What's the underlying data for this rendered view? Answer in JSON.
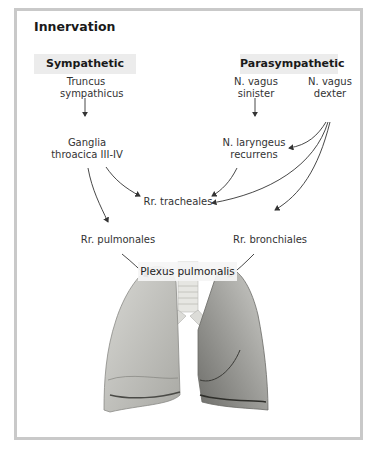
{
  "title": "Innervation",
  "headers": {
    "sympathetic": "Sympathetic",
    "parasympathetic": "Parasympathetic"
  },
  "nodes": {
    "truncus_1": "Truncus",
    "truncus_2": "sympathicus",
    "ganglia_1": "Ganglia",
    "ganglia_2": "throacica III-IV",
    "vagus_sin_1": "N. vagus",
    "vagus_sin_2": "sinister",
    "vagus_dex_1": "N. vagus",
    "vagus_dex_2": "dexter",
    "laryngeus_1": "N. laryngeus",
    "laryngeus_2": "recurrens",
    "tracheales": "Rr. tracheales",
    "pulmonales": "Rr. pulmonales",
    "bronchiales": "Rr. bronchiales",
    "plexus": "Plexus pulmonalis"
  },
  "colors": {
    "frame_border": "#c9c9c9",
    "header_bg": "#ececec",
    "arrow": "#333333"
  }
}
